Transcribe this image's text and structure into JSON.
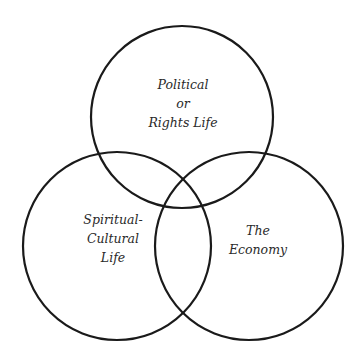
{
  "diagram": {
    "type": "venn",
    "stroke_color": "#1a1a1a",
    "circles": [
      {
        "name": "political",
        "cx": 182,
        "cy": 117,
        "r": 91,
        "label_lines": [
          "Political",
          "or",
          "Rights Life"
        ]
      },
      {
        "name": "spiritual-cultural",
        "cx": 117,
        "cy": 246,
        "r": 94,
        "label_lines": [
          "Spiritual-",
          "Cultural",
          "Life"
        ]
      },
      {
        "name": "economy",
        "cx": 249,
        "cy": 246,
        "r": 94,
        "label_lines": [
          "The",
          "Economy"
        ]
      }
    ]
  }
}
